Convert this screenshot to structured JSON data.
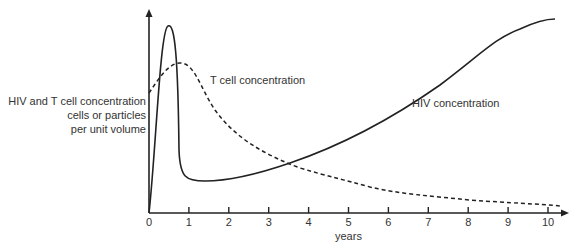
{
  "chart_data": {
    "type": "line",
    "title": "",
    "xlabel": "years",
    "ylabel": [
      "HIV and T cell concentration",
      "cells or particles",
      "per unit volume"
    ],
    "x_ticks": [
      "0",
      "1",
      "2",
      "3",
      "4",
      "5",
      "6",
      "7",
      "8",
      "9",
      "10"
    ],
    "xlim": [
      0,
      10.5
    ],
    "ylim": [
      0,
      1
    ],
    "grid": false,
    "legend": "inline annotations",
    "series": [
      {
        "name": "HIV concentration",
        "style": "solid",
        "x": [
          0,
          0.3,
          0.5,
          0.65,
          0.8,
          1.0,
          1.5,
          2.0,
          3.0,
          4.0,
          5.0,
          6.0,
          7.0,
          8.0,
          9.0,
          10.0,
          10.2
        ],
        "y": [
          0.0,
          0.8,
          0.92,
          0.7,
          0.25,
          0.17,
          0.16,
          0.17,
          0.24,
          0.33,
          0.43,
          0.55,
          0.68,
          0.82,
          0.93,
          0.97,
          0.97
        ]
      },
      {
        "name": "T cell concentration",
        "style": "dashed",
        "x": [
          0,
          0.3,
          0.5,
          0.8,
          1.0,
          1.5,
          2.0,
          3.0,
          4.0,
          5.0,
          6.0,
          7.0,
          8.0,
          9.0,
          10.0,
          10.2
        ],
        "y": [
          0.59,
          0.68,
          0.73,
          0.74,
          0.69,
          0.52,
          0.4,
          0.27,
          0.2,
          0.15,
          0.1,
          0.075,
          0.06,
          0.045,
          0.03,
          0.025
        ]
      }
    ],
    "annotations": [
      {
        "text": "T cell concentration",
        "x": 2.3,
        "y": 0.68
      },
      {
        "text": "HIV concentration",
        "x": 5.8,
        "y": 0.55
      }
    ]
  },
  "labels": {
    "ylabel_line1": "HIV and T cell concentration",
    "ylabel_line2": "cells or particles",
    "ylabel_line3": "per unit volume",
    "xlabel": "years",
    "tcell": "T cell concentration",
    "hiv": "HIV concentration"
  },
  "colors": {
    "line": "#222222",
    "text": "#333333",
    "background": "#ffffff"
  }
}
